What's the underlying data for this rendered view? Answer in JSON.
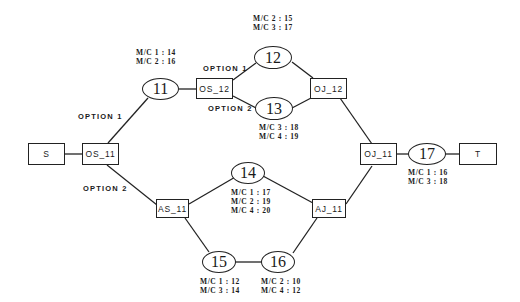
{
  "diagram": {
    "boxes": {
      "S": "S",
      "OS_11": "OS_11",
      "OS_12": "OS_12",
      "OJ_12": "OJ_12",
      "OJ_11": "OJ_11",
      "AS_11": "AS_11",
      "AJ_11": "AJ_11",
      "T": "T"
    },
    "nodes": {
      "n11": "11",
      "n12": "12",
      "n13": "13",
      "n14": "14",
      "n15": "15",
      "n16": "16",
      "n17": "17"
    },
    "options": {
      "os11_opt1": "OPTION 1",
      "os11_opt2": "OPTION 2",
      "os12_opt1": "OPTION 1",
      "os12_opt2": "OPTION 2"
    },
    "machine_labels": {
      "n11": [
        "M/C 1 : 14",
        "M/C 2 : 16"
      ],
      "n12": [
        "M/C 2 : 15",
        "M/C 3 : 17"
      ],
      "n13": [
        "M/C 3 : 18",
        "M/C 4 : 19"
      ],
      "n14": [
        "M/C 1 : 17",
        "M/C 2 : 19",
        "M/C 4 : 20"
      ],
      "n15": [
        "M/C 1 : 12",
        "M/C 3 : 14"
      ],
      "n16": [
        "M/C 2 : 10",
        "M/C 4 : 12"
      ],
      "n17": [
        "M/C 1 : 16",
        "M/C 3 : 18"
      ]
    }
  }
}
